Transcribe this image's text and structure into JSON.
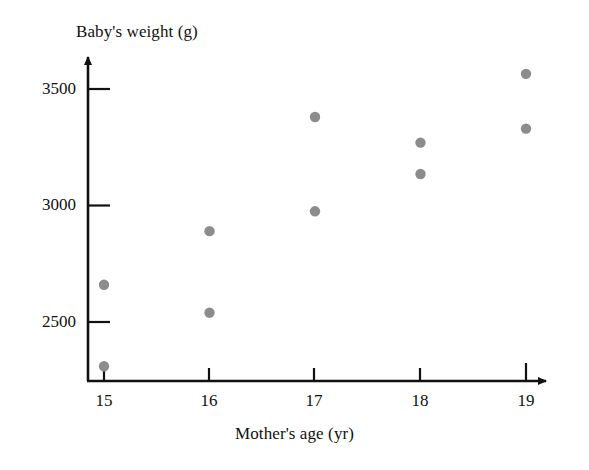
{
  "chart_data": {
    "type": "scatter",
    "title": "",
    "xlabel": "Mother's age (yr)",
    "ylabel": "Baby's weight (g)",
    "xlim": [
      14.6,
      19.45
    ],
    "ylim": [
      2250,
      3640
    ],
    "grid": false,
    "legend": null,
    "xticks": [
      15,
      16,
      17,
      18,
      19
    ],
    "xtick_labels": [
      "15",
      "16",
      "17",
      "18",
      "19"
    ],
    "yticks": [
      2500,
      3000,
      3500
    ],
    "ytick_labels": [
      "2500",
      "3000",
      "3500"
    ],
    "point_color": "#8c8c8c",
    "axis_color": "#111111",
    "points": [
      {
        "x": 15,
        "y": 2660
      },
      {
        "x": 15,
        "y": 2310
      },
      {
        "x": 16,
        "y": 2890
      },
      {
        "x": 16,
        "y": 2540
      },
      {
        "x": 17,
        "y": 3380
      },
      {
        "x": 17,
        "y": 2975
      },
      {
        "x": 18,
        "y": 3270
      },
      {
        "x": 18,
        "y": 3135
      },
      {
        "x": 19,
        "y": 3565
      },
      {
        "x": 19,
        "y": 3330
      }
    ]
  },
  "labels": {
    "y_axis_title": "Baby's weight (g)",
    "x_axis_title": "Mother's age (yr)",
    "y_tick_3500": "3500",
    "y_tick_3000": "3000",
    "y_tick_2500": "2500",
    "x_tick_15": "15",
    "x_tick_16": "16",
    "x_tick_17": "17",
    "x_tick_18": "18",
    "x_tick_19": "19"
  }
}
